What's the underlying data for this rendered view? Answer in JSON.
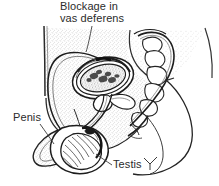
{
  "figure": {
    "kind": "medical-illustration",
    "view": "sagittal-section",
    "background_color": "#ffffff",
    "ink_color": "#1d1d1d",
    "text_color": "#2b2b2b",
    "stipple_color": "#8d8d8d",
    "width": 219,
    "height": 186
  },
  "labels": {
    "title": {
      "line1": "Blockage in",
      "line2": "vas deferens"
    },
    "penis": "Penis",
    "testis": "Testis"
  },
  "structures": [
    {
      "name": "vas-deferens",
      "label_ref": "title"
    },
    {
      "name": "penis",
      "label_ref": "penis"
    },
    {
      "name": "testis",
      "label_ref": "testis"
    },
    {
      "name": "bladder",
      "label_ref": null
    },
    {
      "name": "prostate",
      "label_ref": null
    },
    {
      "name": "sacrum-vertebrae",
      "label_ref": null
    },
    {
      "name": "scrotum",
      "label_ref": null
    },
    {
      "name": "pelvic-body-outline",
      "label_ref": null
    }
  ]
}
